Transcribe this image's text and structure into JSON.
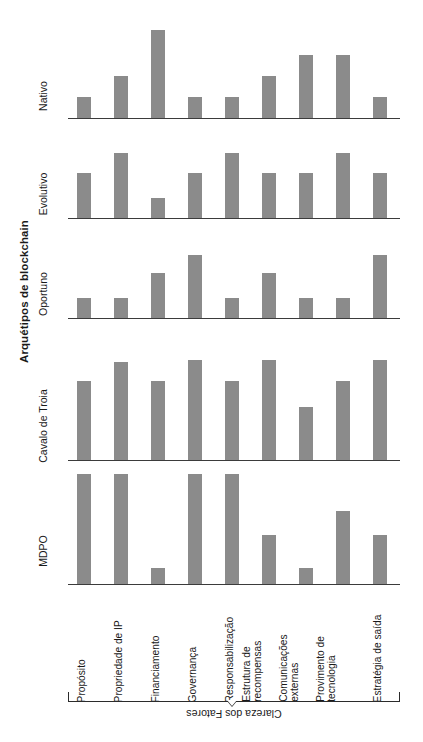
{
  "chart_data": {
    "type": "bar",
    "title": "",
    "ylabel": "Arquétipos de blockchain",
    "xlabel": "Clareza dos Fatores",
    "grid": false,
    "legend": "none",
    "orientation": "rotated-90",
    "ylim": [
      0,
      100
    ],
    "categories": [
      "Propósito",
      "Propriedade de IP",
      "Financiamento",
      "Governança",
      "Responsabilização",
      "Estrutura de recompensas",
      "Comunicações externas",
      "Provimento de tecnologia",
      "Estratégia de saída"
    ],
    "category_lines": [
      [
        "Propósito"
      ],
      [
        "Propriedade de IP"
      ],
      [
        "Financiamento"
      ],
      [
        "Governança"
      ],
      [
        "Responsabilização"
      ],
      [
        "Estrutura de",
        "recompensas"
      ],
      [
        "Comunicações",
        "externas"
      ],
      [
        "Provimento de",
        "tecnologia"
      ],
      [
        "Estratégia de saída"
      ]
    ],
    "panels": [
      "MDPO",
      "Cavalo de Troia",
      "Oportuno",
      "Evolutivo",
      "Nativo"
    ],
    "series": [
      {
        "name": "MDPO",
        "values": [
          100,
          100,
          15,
          100,
          100,
          45,
          15,
          66,
          45
        ]
      },
      {
        "name": "Cavalo de Troia",
        "values": [
          72,
          89,
          72,
          91,
          72,
          91,
          48,
          72,
          91
        ]
      },
      {
        "name": "Oportuno",
        "values": [
          22,
          22,
          50,
          70,
          22,
          50,
          22,
          22,
          70
        ]
      },
      {
        "name": "Evolutivo",
        "values": [
          50,
          72,
          22,
          50,
          72,
          50,
          50,
          72,
          50
        ]
      },
      {
        "name": "Nativo",
        "values": [
          24,
          48,
          100,
          24,
          24,
          48,
          72,
          72,
          24
        ]
      }
    ],
    "bar_color": "#8b8b8b",
    "axis_color": "#3b3b3b"
  },
  "layout": {
    "panel_tops": [
      470,
      346,
      224,
      124,
      26
    ],
    "panel_heights": [
      114,
      114,
      94,
      94,
      92
    ],
    "panel_baselines": [
      584,
      460,
      318,
      218,
      118
    ],
    "label_tops": [
      545,
      420,
      288,
      188,
      90
    ],
    "bar_step": 37,
    "bar_first_offset": 9,
    "bar_width": 14
  }
}
